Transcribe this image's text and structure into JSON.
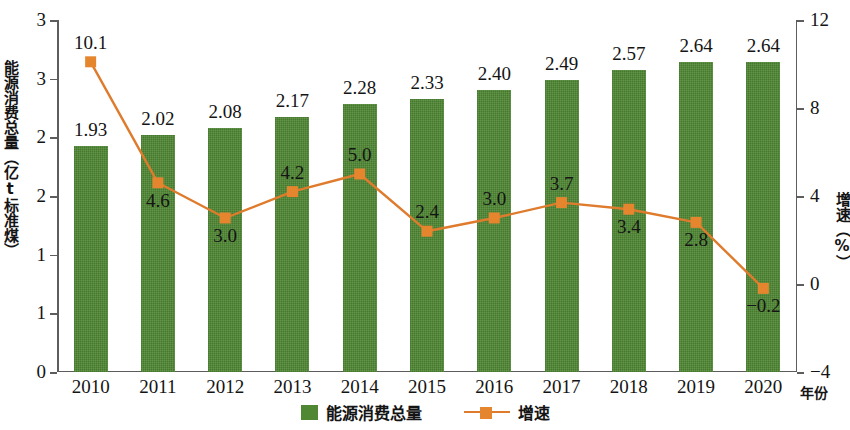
{
  "chart_data": {
    "type": "bar",
    "title": "",
    "xlabel": "年份",
    "ylabel": "能源消费总量（亿t标准煤）",
    "y2label": "增速（%）",
    "categories": [
      "2010",
      "2011",
      "2012",
      "2013",
      "2014",
      "2015",
      "2016",
      "2017",
      "2018",
      "2019",
      "2020"
    ],
    "ylim": [
      0,
      3.0
    ],
    "y2lim": [
      -4,
      12
    ],
    "grid": false,
    "legend_position": "bottom",
    "left_tick_labels": [
      "3",
      "3",
      "2",
      "2",
      "1",
      "1",
      "0"
    ],
    "left_tick_values": [
      3.0,
      2.5,
      2.0,
      1.5,
      1.0,
      0.5,
      0.0
    ],
    "right_tick_labels": [
      "12",
      "8",
      "4",
      "0",
      "−4"
    ],
    "right_tick_values": [
      12,
      8,
      4,
      0,
      -4
    ],
    "series": [
      {
        "name": "能源消费总量",
        "type": "bar",
        "color": "#4f8733",
        "unit": "亿t标准煤",
        "values": [
          1.93,
          2.02,
          2.08,
          2.17,
          2.28,
          2.33,
          2.4,
          2.49,
          2.57,
          2.64,
          2.64
        ],
        "labels": [
          "1.93",
          "2.02",
          "2.08",
          "2.17",
          "2.28",
          "2.33",
          "2.40",
          "2.49",
          "2.57",
          "2.64",
          "2.64"
        ]
      },
      {
        "name": "增速",
        "type": "line",
        "axis": "right",
        "color": "#df7b2c",
        "marker_color": "#e5862f",
        "unit": "%",
        "values": [
          10.1,
          4.6,
          3.0,
          4.2,
          5.0,
          2.4,
          3.0,
          3.7,
          3.4,
          2.8,
          -0.2
        ],
        "labels": [
          "10.1",
          "4.6",
          "3.0",
          "4.2",
          "5.0",
          "2.4",
          "3.0",
          "3.7",
          "3.4",
          "2.8",
          "−0.2"
        ],
        "label_positions": [
          "above",
          "below",
          "below",
          "above",
          "above",
          "above",
          "above",
          "above",
          "below",
          "below",
          "below"
        ]
      }
    ]
  },
  "legend": {
    "items": [
      {
        "label": "能源消费总量",
        "kind": "bar",
        "color": "#4f8733"
      },
      {
        "label": "增速",
        "kind": "line",
        "color": "#df7b2c"
      }
    ]
  }
}
